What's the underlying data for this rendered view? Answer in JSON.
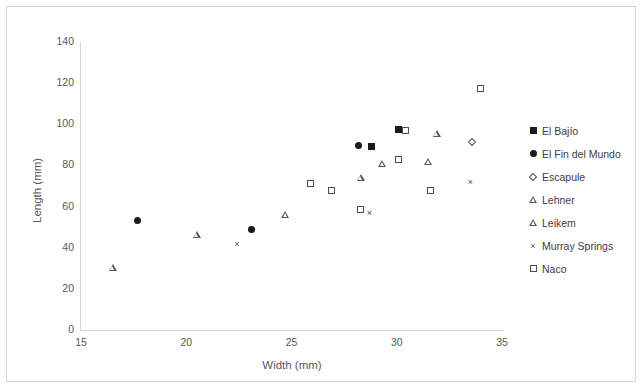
{
  "chart_data": {
    "type": "scatter",
    "title": "",
    "xlabel": "Width (mm)",
    "ylabel": "Length (mm)",
    "xlim": [
      15,
      35
    ],
    "ylim": [
      0,
      140
    ],
    "xticks": [
      "15",
      "20",
      "25",
      "30",
      "35"
    ],
    "yticks": [
      "0",
      "20",
      "40",
      "60",
      "80",
      "100",
      "120",
      "140"
    ],
    "grid": false,
    "legend_position": "right",
    "series": [
      {
        "name": "El Bajío",
        "marker": "filled-square",
        "points": [
          {
            "x": 28.8,
            "y": 89.0
          },
          {
            "x": 30.1,
            "y": 97.5
          }
        ]
      },
      {
        "name": "El Fin del Mundo",
        "marker": "filled-circle",
        "points": [
          {
            "x": 17.7,
            "y": 53.0
          },
          {
            "x": 23.1,
            "y": 49.0
          },
          {
            "x": 28.2,
            "y": 89.5
          }
        ]
      },
      {
        "name": "Escapule",
        "marker": "open-diamond",
        "points": [
          {
            "x": 33.6,
            "y": 91.0
          }
        ]
      },
      {
        "name": "Lehner",
        "marker": "open-triangle",
        "points": [
          {
            "x": 16.5,
            "y": 30.5
          },
          {
            "x": 20.5,
            "y": 46.5
          },
          {
            "x": 28.3,
            "y": 74.0
          },
          {
            "x": 29.3,
            "y": 81.0
          },
          {
            "x": 31.5,
            "y": 82.0
          },
          {
            "x": 31.9,
            "y": 95.5
          }
        ]
      },
      {
        "name": "Leikem",
        "marker": "open-triangle",
        "points": [
          {
            "x": 24.7,
            "y": 56.0
          }
        ]
      },
      {
        "name": "Murray Springs",
        "marker": "cross",
        "points": [
          {
            "x": 22.4,
            "y": 42.0
          },
          {
            "x": 28.7,
            "y": 57.0
          },
          {
            "x": 33.5,
            "y": 72.0
          }
        ]
      },
      {
        "name": "Naco",
        "marker": "open-square",
        "points": [
          {
            "x": 25.9,
            "y": 71.0
          },
          {
            "x": 26.9,
            "y": 68.0
          },
          {
            "x": 28.3,
            "y": 58.5
          },
          {
            "x": 30.1,
            "y": 83.0
          },
          {
            "x": 30.4,
            "y": 97.0
          },
          {
            "x": 31.6,
            "y": 68.0
          },
          {
            "x": 34.0,
            "y": 117.5
          }
        ]
      }
    ]
  },
  "axes": {
    "x_title": "Width (mm)",
    "y_title": "Length (mm)"
  },
  "legend": {
    "items": [
      {
        "label": "El Bajío",
        "marker": "filled-square"
      },
      {
        "label": "El Fin del Mundo",
        "marker": "filled-circle"
      },
      {
        "label": "Escapule",
        "marker": "open-diamond"
      },
      {
        "label": "Lehner",
        "marker": "open-triangle"
      },
      {
        "label": "Leikem",
        "marker": "open-triangle"
      },
      {
        "label": "Murray Springs",
        "marker": "cross"
      },
      {
        "label": "Naco",
        "marker": "open-square"
      }
    ]
  },
  "colors": {
    "marker_fill": "#1a1a1a",
    "marker_stroke": "#4d4d4d",
    "axis": "#d9d9d9",
    "text": "#595959",
    "frame": "#d4d4d4",
    "background": "#ffffff"
  }
}
